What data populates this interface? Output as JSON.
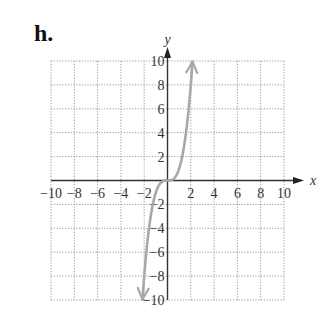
{
  "problem_label": "h.",
  "chart_data": {
    "type": "line",
    "title": "",
    "function": "y = x^3",
    "xlabel": "x",
    "ylabel": "y",
    "xlim": [
      -10,
      10
    ],
    "ylim": [
      -10,
      10
    ],
    "grid": true,
    "grid_step": 2,
    "x_ticks": [
      -10,
      -8,
      -6,
      -4,
      -2,
      2,
      4,
      6,
      8,
      10
    ],
    "y_ticks": [
      -10,
      -8,
      -6,
      -4,
      -2,
      2,
      4,
      6,
      8,
      10
    ],
    "x_tick_labels": [
      "−10",
      "−8",
      "−6",
      "−4",
      "−2",
      "2",
      "4",
      "6",
      "8",
      "10"
    ],
    "y_tick_labels": [
      "−10",
      "−8",
      "−6",
      "−4",
      "−2",
      "2",
      "4",
      "6",
      "8",
      "10"
    ],
    "series": [
      {
        "name": "curve",
        "color": "#a8a8a8",
        "arrows": "both",
        "x": [
          -2.15,
          -2,
          -1.5,
          -1,
          -0.5,
          0,
          0.5,
          1,
          1.5,
          2,
          2.15
        ],
        "y": [
          -9.94,
          -8,
          -3.38,
          -1,
          -0.13,
          0,
          0.13,
          1,
          3.38,
          8,
          9.94
        ]
      }
    ],
    "legend": null
  }
}
